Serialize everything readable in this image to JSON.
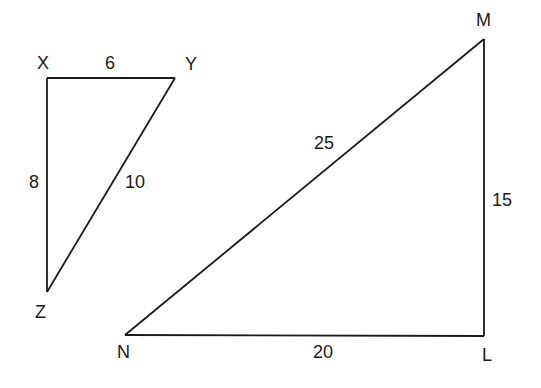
{
  "triangles": [
    {
      "name": "XYZ",
      "vertices": {
        "a": "X",
        "b": "Y",
        "c": "Z"
      },
      "sides": {
        "XY": "6",
        "YZ": "10",
        "XZ": "8"
      }
    },
    {
      "name": "MNL",
      "vertices": {
        "a": "M",
        "b": "N",
        "c": "L"
      },
      "sides": {
        "MN": "25",
        "ML": "15",
        "NL": "20"
      }
    }
  ],
  "colors": {
    "stroke": "#1a1a1a",
    "background": "#ffffff"
  }
}
